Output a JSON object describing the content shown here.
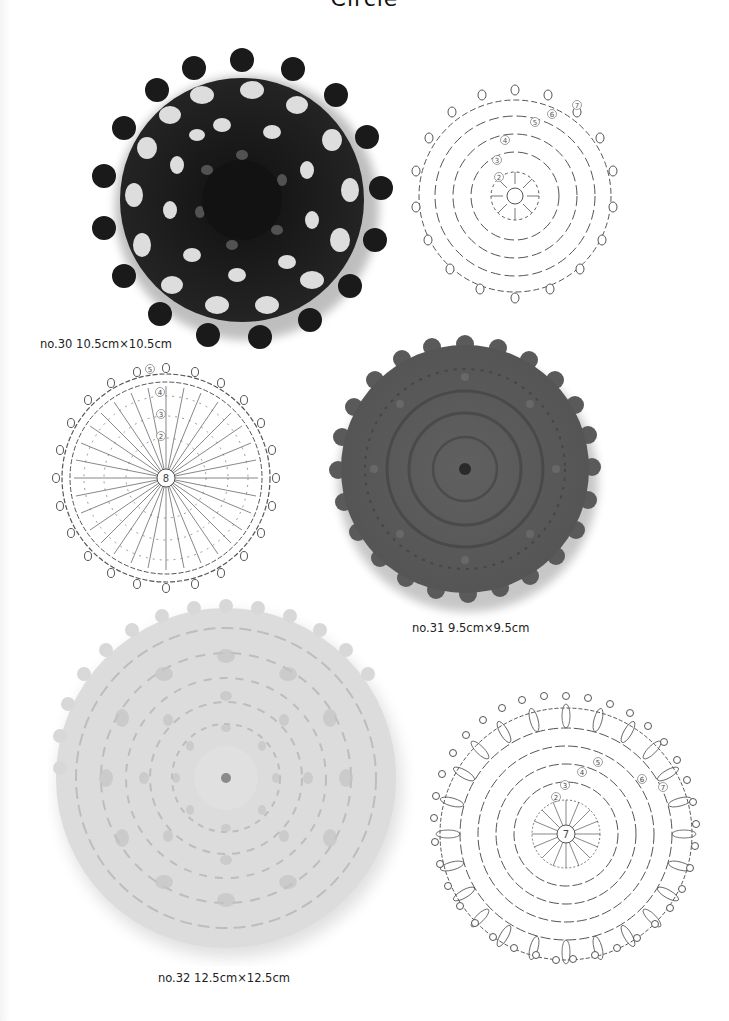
{
  "page": {
    "title": "Circle"
  },
  "colors": {
    "background": "#ffffff",
    "diagram_line": "#555555",
    "piece_30": "#1c1c1c",
    "piece_31": "#5b5b5b",
    "piece_32": "#dcdcdc"
  },
  "pieces": [
    {
      "id": "no30",
      "caption": "no.30 10.5cm×10.5cm",
      "number": "no.30",
      "size": "10.5cm×10.5cm",
      "color_name": "black",
      "diagram": {
        "center_label": "",
        "round_labels": [
          "2",
          "3",
          "4",
          "5",
          "6",
          "7"
        ],
        "scallops": 17
      }
    },
    {
      "id": "no31",
      "caption": "no.31 9.5cm×9.5cm",
      "number": "no.31",
      "size": "9.5cm×9.5cm",
      "color_name": "dark gray",
      "diagram": {
        "center_label": "8",
        "round_labels": [
          "2",
          "3",
          "4",
          "5"
        ],
        "scallops": 24
      }
    },
    {
      "id": "no32",
      "caption": "no.32 12.5cm×12.5cm",
      "number": "no.32",
      "size": "12.5cm×12.5cm",
      "color_name": "light gray",
      "diagram": {
        "center_label": "7",
        "round_labels": [
          "2",
          "3",
          "4",
          "5",
          "6",
          "7"
        ],
        "scallops": 32
      }
    }
  ]
}
